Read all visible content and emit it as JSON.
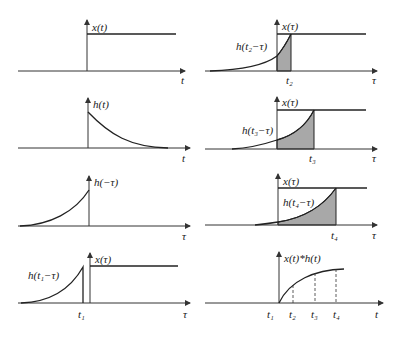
{
  "panels": {
    "left": [
      {
        "id": "x_t",
        "ylabel": "x(t)",
        "xlabel": "t"
      },
      {
        "id": "h_t",
        "ylabel": "h(t)",
        "xlabel": "t"
      },
      {
        "id": "h_neg_tau",
        "ylabel": "h(−τ)",
        "xlabel": "τ"
      },
      {
        "id": "h_t1_minus_tau",
        "ylabel": "x(τ)",
        "curve_label": "h(t₁−τ)",
        "tick": "t₁",
        "xlabel": "τ"
      }
    ],
    "right": [
      {
        "id": "h_t2_minus_tau",
        "ylabel": "x(τ)",
        "curve_label": "h(t₂−τ)",
        "tick": "t₂",
        "xlabel": "τ"
      },
      {
        "id": "h_t3_minus_tau",
        "ylabel": "x(τ)",
        "curve_label": "h(t₃−τ)",
        "tick": "t₃",
        "xlabel": "τ"
      },
      {
        "id": "h_t4_minus_tau",
        "ylabel": "x(τ)",
        "curve_label": "h(t₄−τ)",
        "tick": "t₄",
        "xlabel": "τ"
      },
      {
        "id": "convolution",
        "ylabel": "x(t)*h(t)",
        "ticks": [
          "t₁",
          "t₂",
          "t₃",
          "t₄"
        ],
        "xlabel": "t"
      }
    ]
  },
  "colors": {
    "line": "#222222",
    "shade": "#a8a8a8",
    "background": "#ffffff"
  }
}
